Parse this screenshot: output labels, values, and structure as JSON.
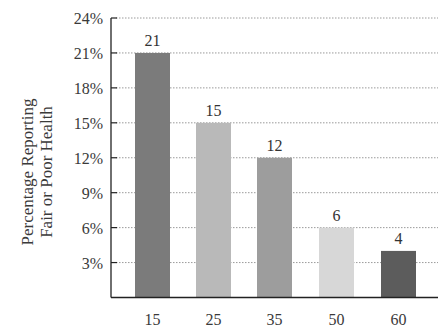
{
  "chart_data": {
    "type": "bar",
    "title": "",
    "xlabel": "",
    "ylabel": [
      "Percentage Reporting",
      "Fair or Poor Health"
    ],
    "categories": [
      "15",
      "25",
      "35",
      "50",
      "60"
    ],
    "values": [
      21,
      15,
      12,
      6,
      4
    ],
    "value_labels": [
      "21",
      "15",
      "12",
      "6",
      "4"
    ],
    "bar_colors": [
      "#7b7b7b",
      "#b9b9b9",
      "#9d9d9d",
      "#d7d7d7",
      "#5c5c5c"
    ],
    "ylim": [
      0,
      24
    ],
    "yticks": [
      3,
      6,
      9,
      12,
      15,
      18,
      21,
      24
    ],
    "ytick_labels": [
      "3%",
      "6%",
      "9%",
      "12%",
      "15%",
      "18%",
      "21%",
      "24%"
    ],
    "grid": "horizontal dotted",
    "legend": null
  }
}
